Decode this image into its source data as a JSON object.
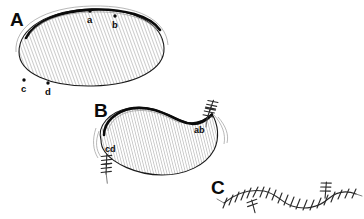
{
  "figure": {
    "background_color": "#ffffff",
    "ink_color": "#0b0b0b",
    "hatch_color": "#8c8c8c",
    "width": 364,
    "height": 219
  },
  "panels": [
    {
      "id": "A",
      "letter": "A",
      "description": "Hatched elliptical tissue area with four marked boundary points",
      "letter_position": {
        "x": 10,
        "y": 26
      },
      "points": [
        {
          "label": "a",
          "dot": {
            "x": 90,
            "y": 11
          },
          "text": {
            "x": 87,
            "y": 23
          }
        },
        {
          "label": "b",
          "dot": {
            "x": 115,
            "y": 16
          },
          "text": {
            "x": 112,
            "y": 28
          }
        },
        {
          "label": "c",
          "dot": {
            "x": 24,
            "y": 80
          },
          "text": {
            "x": 21,
            "y": 92
          }
        },
        {
          "label": "d",
          "dot": {
            "x": 48,
            "y": 83
          },
          "text": {
            "x": 45,
            "y": 95
          }
        }
      ]
    },
    {
      "id": "B",
      "letter": "B",
      "description": "Closed defect after advancement, with sutured dog-ear corners",
      "letter_position": {
        "x": 94,
        "y": 117
      },
      "points": [
        {
          "label": "ab",
          "text": {
            "x": 194,
            "y": 133
          }
        },
        {
          "label": "cd",
          "text": {
            "x": 105,
            "y": 152
          }
        }
      ]
    },
    {
      "id": "C",
      "letter": "C",
      "description": "Final wavy suture line closure",
      "letter_position": {
        "x": 211,
        "y": 194
      },
      "points": []
    }
  ],
  "colors": {
    "outline": "#1a1a1a",
    "heavy_outline": "#0b0b0b",
    "suture": "#2b2b2b",
    "wisp": "#9a9a9a"
  }
}
